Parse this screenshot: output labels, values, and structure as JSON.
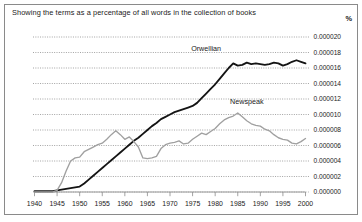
{
  "figure": {
    "caption": "Showing the terms as a percentage of all words in the collection of books",
    "unit_label": "%"
  },
  "chart_data": {
    "type": "line",
    "title": "Showing the terms as a percentage of all words in the collection of books",
    "xlabel": "",
    "ylabel": "%",
    "xlim": [
      1940,
      2000
    ],
    "ylim": [
      0.0,
      2e-05
    ],
    "grid": true,
    "legend_position": "inline-labels",
    "xticks": [
      1940,
      1945,
      1950,
      1955,
      1960,
      1965,
      1970,
      1975,
      1980,
      1985,
      1990,
      1995,
      2000
    ],
    "xtick_labels": [
      "1940",
      "1945",
      "1950",
      "1955",
      "1960",
      "1965",
      "1970",
      "1975",
      "1980",
      "1985",
      "1990",
      "1995",
      "2000"
    ],
    "yticks": [
      0.0,
      2e-06,
      4e-06,
      6e-06,
      8e-06,
      1e-05,
      1.2e-05,
      1.4e-05,
      1.6e-05,
      1.8e-05,
      2e-05
    ],
    "ytick_labels": [
      "0.000000",
      "0.000002",
      "0.000004",
      "0.000006",
      "0.000008",
      "0.000010",
      "0.000012",
      "0.000014",
      "0.000016",
      "0.000018",
      "0.000020"
    ],
    "x": [
      1940,
      1941,
      1942,
      1943,
      1944,
      1945,
      1946,
      1947,
      1948,
      1949,
      1950,
      1951,
      1952,
      1953,
      1954,
      1955,
      1956,
      1957,
      1958,
      1959,
      1960,
      1961,
      1962,
      1963,
      1964,
      1965,
      1966,
      1967,
      1968,
      1969,
      1970,
      1971,
      1972,
      1973,
      1974,
      1975,
      1976,
      1977,
      1978,
      1979,
      1980,
      1981,
      1982,
      1983,
      1984,
      1985,
      1986,
      1987,
      1988,
      1989,
      1990,
      1991,
      1992,
      1993,
      1994,
      1995,
      1996,
      1997,
      1998,
      1999,
      2000
    ],
    "series": [
      {
        "name": "Orwellian",
        "color": "#141414",
        "label_x": 1978,
        "label_y": 1.82e-05,
        "values": [
          1e-07,
          1e-07,
          1e-07,
          1e-07,
          1e-07,
          2e-07,
          3e-07,
          4e-07,
          5e-07,
          6e-07,
          7e-07,
          1.1e-06,
          1.6e-06,
          2.1e-06,
          2.6e-06,
          3.1e-06,
          3.6e-06,
          4.1e-06,
          4.6e-06,
          5.1e-06,
          5.6e-06,
          6.1e-06,
          6.6e-06,
          7e-06,
          7.5e-06,
          8e-06,
          8.5e-06,
          8.9e-06,
          9.4e-06,
          9.7e-06,
          1e-05,
          1.03e-05,
          1.05e-05,
          1.07e-05,
          1.09e-05,
          1.11e-05,
          1.15e-05,
          1.21e-05,
          1.27e-05,
          1.33e-05,
          1.39e-05,
          1.46e-05,
          1.53e-05,
          1.6e-05,
          1.66e-05,
          1.63e-05,
          1.64e-05,
          1.67e-05,
          1.65e-05,
          1.66e-05,
          1.65e-05,
          1.64e-05,
          1.65e-05,
          1.67e-05,
          1.66e-05,
          1.63e-05,
          1.65e-05,
          1.68e-05,
          1.7e-05,
          1.68e-05,
          1.66e-05
        ]
      },
      {
        "name": "Newspeak",
        "color": "#a0a0a0",
        "label_x": 1987,
        "label_y": 1.13e-05,
        "values": [
          0.0,
          0.0,
          0.0,
          0.0,
          0.0,
          2e-07,
          1.2e-06,
          2.7e-06,
          4e-06,
          4.4e-06,
          4.5e-06,
          5.2e-06,
          5.5e-06,
          5.8e-06,
          6.1e-06,
          6.3e-06,
          6.8e-06,
          7.4e-06,
          7.9e-06,
          7.4e-06,
          6.8e-06,
          7.1e-06,
          6.5e-06,
          5.8e-06,
          4.4e-06,
          4.3e-06,
          4.4e-06,
          4.6e-06,
          5.6e-06,
          6.1e-06,
          6.3e-06,
          6.4e-06,
          6.6e-06,
          6.2e-06,
          6.3e-06,
          6.8e-06,
          7.2e-06,
          7.6e-06,
          7.4e-06,
          7.8e-06,
          8.2e-06,
          8.8e-06,
          9.3e-06,
          9.6e-06,
          9.8e-06,
          1.02e-05,
          9.7e-06,
          9.2e-06,
          8.8e-06,
          8.6e-06,
          8.5e-06,
          8.1e-06,
          7.9e-06,
          7.4e-06,
          7e-06,
          6.8e-06,
          6.7e-06,
          6.3e-06,
          6.2e-06,
          6.5e-06,
          6.9e-06
        ]
      }
    ]
  }
}
